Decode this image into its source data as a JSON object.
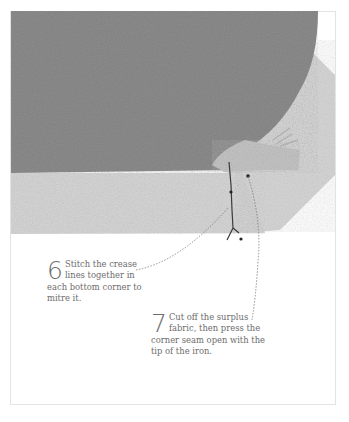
{
  "figure": {
    "colors": {
      "fabric": "#8e8e8e",
      "hem": "#d8d8d8",
      "fold": "#c9c9c9",
      "text": "#6d6d6d",
      "frame": "#e3e3e3"
    },
    "illustration": "fabric-corner-mitre"
  },
  "steps": [
    {
      "number": "6",
      "text": "Stitch the crease lines together in each bottom corner to mitre it."
    },
    {
      "number": "7",
      "text": "Cut off the surplus fabric, then press the corner seam open with the tip of the iron."
    }
  ]
}
